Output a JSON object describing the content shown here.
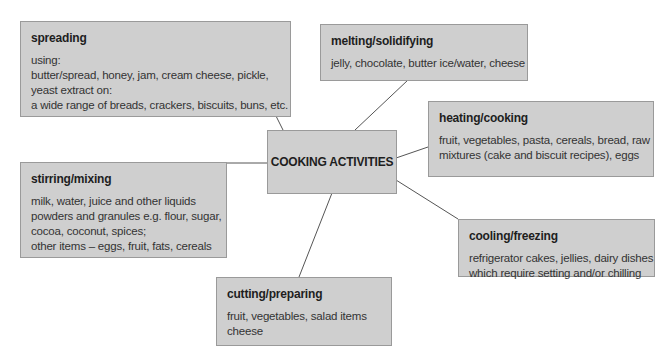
{
  "center": {
    "label": "COOKING ACTIVITIES"
  },
  "colors": {
    "box_fill": "#cfcfcf",
    "box_border": "#9a9a9a",
    "line": "#555555",
    "background": "#ffffff"
  },
  "nodes": {
    "spreading": {
      "title": "spreading",
      "lines": [
        "using:",
        "butter/spread, honey, jam, cream cheese, pickle,",
        "yeast extract on:",
        "a wide range of breads, crackers, biscuits, buns, etc."
      ]
    },
    "melting": {
      "title": "melting/solidifying",
      "lines": [
        "jelly, chocolate, butter ice/water, cheese"
      ]
    },
    "heating": {
      "title": "heating/cooking",
      "lines": [
        "fruit, vegetables, pasta, cereals, bread, raw",
        "mixtures (cake and biscuit recipes), eggs"
      ]
    },
    "stirring": {
      "title": "stirring/mixing",
      "lines": [
        "milk, water, juice and other liquids",
        "powders and granules e.g. flour, sugar,",
        "cocoa, coconut, spices;",
        "other items – eggs, fruit, fats, cereals"
      ]
    },
    "cooling": {
      "title": "cooling/freezing",
      "lines": [
        "refrigerator cakes, jellies, dairy dishes",
        "which require setting and/or chilling"
      ]
    },
    "cutting": {
      "title": "cutting/preparing",
      "lines": [
        "fruit, vegetables, salad items",
        "cheese"
      ]
    }
  }
}
